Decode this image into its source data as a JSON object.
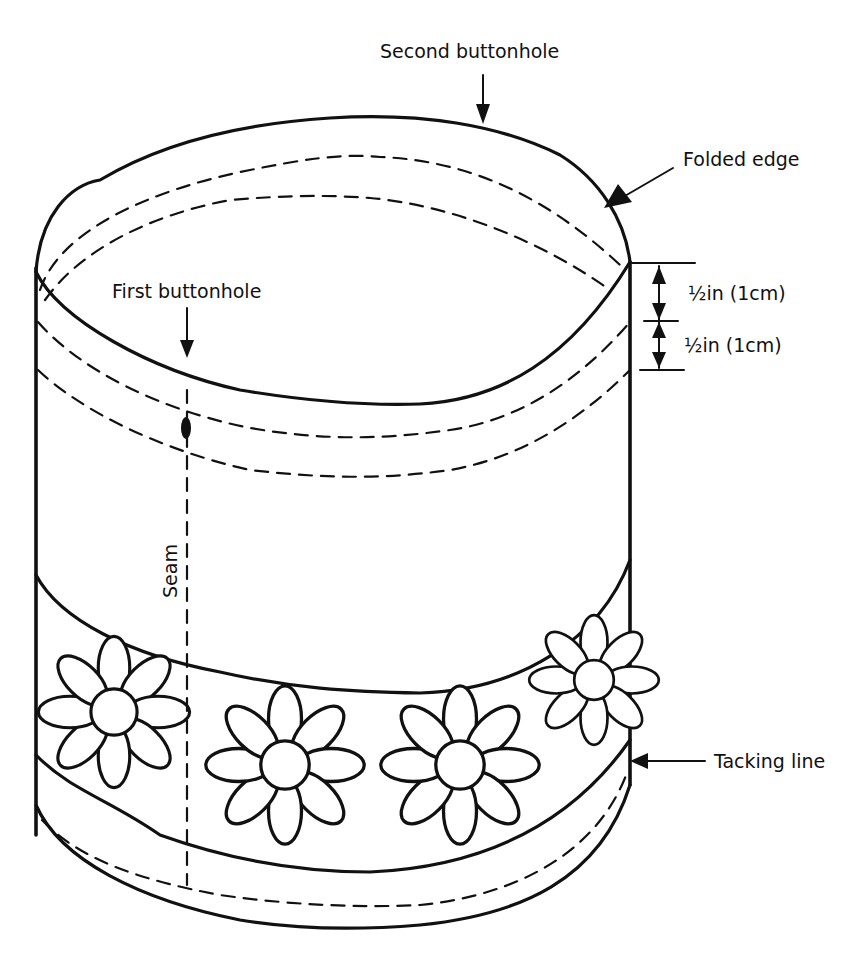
{
  "diagram": {
    "background_color": "#ffffff",
    "ink_color": "#111111",
    "labels": {
      "second_buttonhole": "Second buttonhole",
      "folded_edge": "Folded edge",
      "first_buttonhole": "First buttonhole",
      "measurement_top": "½in (1cm)",
      "measurement_bottom": "½in (1cm)",
      "seam": "Seam",
      "tacking_line": "Tacking line"
    },
    "flower_count": 5
  }
}
